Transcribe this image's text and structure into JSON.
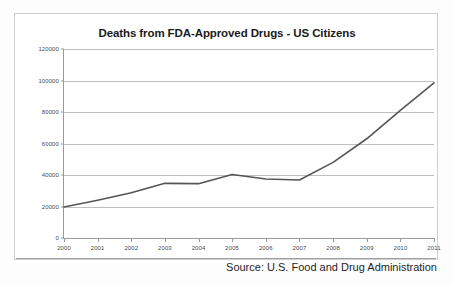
{
  "chart_data": {
    "type": "line",
    "title": "Deaths from FDA-Approved Drugs - US Citizens",
    "xlabel": "",
    "ylabel": "",
    "categories": [
      "2000",
      "2001",
      "2002",
      "2003",
      "2004",
      "2005",
      "2006",
      "2007",
      "2008",
      "2009",
      "2010",
      "2011"
    ],
    "values": [
      19700,
      24000,
      28700,
      34700,
      34500,
      40300,
      37500,
      36800,
      48000,
      63000,
      81000,
      98500
    ],
    "series": [
      {
        "name": "Deaths",
        "values": [
          19700,
          24000,
          28700,
          34700,
          34500,
          40300,
          37500,
          36800,
          48000,
          63000,
          81000,
          98500
        ]
      }
    ],
    "ylim": [
      0,
      120000
    ],
    "ytick_labels": [
      "0",
      "20000",
      "40000",
      "60000",
      "80000",
      "100000",
      "120000"
    ],
    "ytick_values": [
      0,
      20000,
      40000,
      60000,
      80000,
      100000,
      120000
    ],
    "grid": true,
    "legend": false,
    "legend_position": "none",
    "line_color": "#555555",
    "grid_color": "#bfbfbf",
    "axis_color": "#9a9a9a",
    "background_color": "#ffffff"
  },
  "footer": {
    "source_note": "Source: U.S. Food and Drug Administration"
  }
}
